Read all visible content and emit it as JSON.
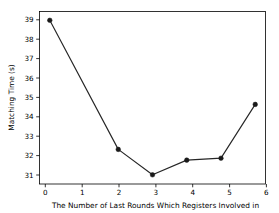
{
  "chart_data": {
    "type": "line",
    "title": "",
    "xlabel": "The Number of Last Rounds Which Registers Involved in",
    "ylabel": "Matching Time (s)",
    "x": [
      0,
      1,
      2,
      3,
      4,
      5,
      6
    ],
    "values": [
      39.15,
      null,
      32.55,
      31.25,
      32.0,
      32.1,
      34.85
    ],
    "series": [
      {
        "name": "Matching Time",
        "x": [
          0,
          2,
          3,
          4,
          5,
          6
        ],
        "values": [
          39.15,
          32.55,
          31.25,
          32.0,
          32.1,
          34.85
        ],
        "color": "#262626",
        "marker": "circle",
        "linestyle": "solid"
      }
    ],
    "xlim": [
      -0.3,
      6.3
    ],
    "ylim": [
      30.78,
      39.6
    ],
    "xticks": [
      0,
      1,
      2,
      3,
      4,
      5,
      6
    ],
    "xticklabels": [
      "0",
      "1",
      "2",
      "3",
      "4",
      "5",
      "6"
    ],
    "yticks": [
      31,
      32,
      33,
      34,
      35,
      36,
      37,
      38,
      39
    ],
    "yticklabels": [
      "31",
      "32",
      "33",
      "34",
      "35",
      "36",
      "37",
      "38",
      "39"
    ],
    "grid": false,
    "legend": null,
    "background": "#ffffff",
    "frame_color": "#000000"
  }
}
